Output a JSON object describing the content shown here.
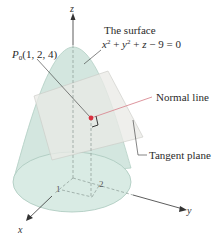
{
  "figure": {
    "surface_label_line1": "The surface",
    "surface_equation": {
      "x": "x",
      "y": "y",
      "z": "z",
      "exp": "2",
      "rest": " − 9 = 0"
    },
    "point_label": {
      "name": "P",
      "sub": "0",
      "coords": "(1, 2, 4)"
    },
    "normal_label": "Normal line",
    "plane_label": "Tangent plane",
    "axes": {
      "x": "x",
      "y": "y",
      "z": "z"
    },
    "ticks": {
      "x1": "1",
      "y2": "2"
    },
    "colors": {
      "surface_fill": "#cfe3dc",
      "surface_edge": "#a9c8bd",
      "plane_fill": "#e6e6e3",
      "normal_line": "#d98a93",
      "point": "#d9303f",
      "axis": "#333333"
    }
  }
}
